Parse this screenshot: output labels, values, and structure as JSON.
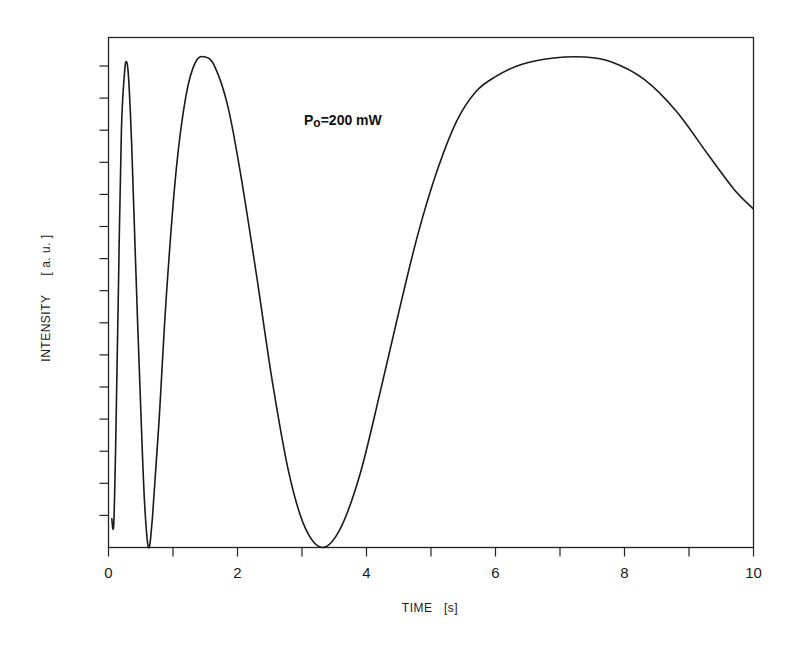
{
  "chart_data": {
    "type": "line",
    "title": "",
    "xlabel": "TIME   [s]",
    "ylabel": "INTENSITY     [ a. u. ]",
    "xlim": [
      0,
      10
    ],
    "ylim": [
      0,
      1
    ],
    "x_ticks_major": [
      0,
      2,
      4,
      6,
      8,
      10
    ],
    "x_tick_labels": [
      "0",
      "2",
      "4",
      "6",
      "8",
      "10"
    ],
    "x_ticks_minor": [
      1,
      3,
      5,
      7,
      9
    ],
    "y_tick_count": 15,
    "y_tick_labels": [],
    "grid": false,
    "annotation": {
      "main": "P",
      "sub": "o",
      "rest": "=200 mW",
      "x": 3.0,
      "y": 0.92
    },
    "series": [
      {
        "name": "intensity",
        "color": "#1a1a1a",
        "points": [
          [
            0.05,
            0.06
          ],
          [
            0.08,
            0.045
          ],
          [
            0.11,
            0.2
          ],
          [
            0.15,
            0.5
          ],
          [
            0.2,
            0.85
          ],
          [
            0.25,
            0.97
          ],
          [
            0.28,
            0.99
          ],
          [
            0.31,
            0.96
          ],
          [
            0.36,
            0.82
          ],
          [
            0.42,
            0.58
          ],
          [
            0.5,
            0.28
          ],
          [
            0.56,
            0.09
          ],
          [
            0.62,
            0.0
          ],
          [
            0.68,
            0.06
          ],
          [
            0.78,
            0.25
          ],
          [
            0.9,
            0.52
          ],
          [
            1.05,
            0.77
          ],
          [
            1.2,
            0.92
          ],
          [
            1.35,
            0.99
          ],
          [
            1.5,
            1.0
          ],
          [
            1.65,
            0.98
          ],
          [
            1.85,
            0.9
          ],
          [
            2.05,
            0.76
          ],
          [
            2.3,
            0.55
          ],
          [
            2.55,
            0.33
          ],
          [
            2.8,
            0.15
          ],
          [
            3.05,
            0.04
          ],
          [
            3.32,
            0.0
          ],
          [
            3.6,
            0.04
          ],
          [
            3.9,
            0.15
          ],
          [
            4.2,
            0.31
          ],
          [
            4.5,
            0.48
          ],
          [
            4.8,
            0.64
          ],
          [
            5.1,
            0.77
          ],
          [
            5.4,
            0.87
          ],
          [
            5.7,
            0.93
          ],
          [
            6.0,
            0.96
          ],
          [
            6.4,
            0.985
          ],
          [
            6.9,
            0.998
          ],
          [
            7.38,
            1.0
          ],
          [
            7.8,
            0.99
          ],
          [
            8.3,
            0.955
          ],
          [
            8.8,
            0.89
          ],
          [
            9.3,
            0.8
          ],
          [
            9.7,
            0.73
          ],
          [
            10.0,
            0.69
          ]
        ]
      }
    ]
  }
}
